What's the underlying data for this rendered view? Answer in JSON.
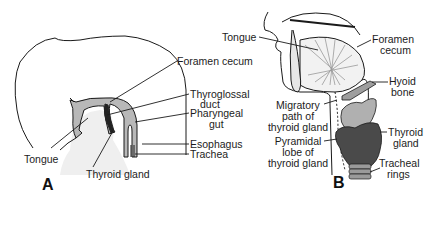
{
  "diagram": {
    "panel_a": {
      "letter": "A",
      "labels": {
        "foramen_cecum": "Foramen cecum",
        "thyroglossal_duct_1": "Thyroglossal",
        "thyroglossal_duct_2": "duct",
        "pharyngeal_gut_1": "Pharyngeal",
        "pharyngeal_gut_2": "gut",
        "esophagus": "Esophagus",
        "trachea": "Trachea",
        "tongue": "Tongue",
        "thyroid_gland": "Thyroid gland"
      }
    },
    "panel_b": {
      "letter": "B",
      "labels": {
        "tongue": "Tongue",
        "foramen_cecum_1": "Foramen",
        "foramen_cecum_2": "cecum",
        "hyoid_bone_1": "Hyoid",
        "hyoid_bone_2": "bone",
        "migratory_path_1": "Migratory",
        "migratory_path_2": "path of",
        "migratory_path_3": "thyroid gland",
        "thyroid_gland_1": "Thyroid",
        "thyroid_gland_2": "gland",
        "pyramidal_lobe_1": "Pyramidal",
        "pyramidal_lobe_2": "lobe of",
        "pyramidal_lobe_3": "thyroid gland",
        "tracheal_rings_1": "Tracheal",
        "tracheal_rings_2": "rings"
      }
    },
    "colors": {
      "line": "#1a1a1a",
      "tissue_gray": "#b8b8b8",
      "thyroid_dark": "#4a4a4a",
      "stipple": "#ececec"
    }
  }
}
